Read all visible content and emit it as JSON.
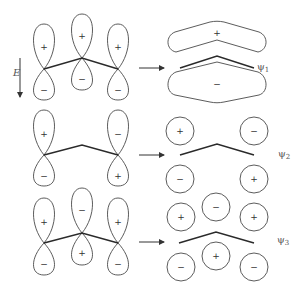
{
  "figure": {
    "energy_axis_label": "E",
    "rows": [
      {
        "id": "psi1",
        "label": "ψ",
        "subscript": "1",
        "p_orbitals": [
          {
            "top_sign": "+",
            "bottom_sign": "−"
          },
          {
            "top_sign": "+",
            "bottom_sign": "−"
          },
          {
            "top_sign": "+",
            "bottom_sign": "−"
          }
        ],
        "mo_signs": {
          "top": "+",
          "bottom": "−"
        }
      },
      {
        "id": "psi2",
        "label": "ψ",
        "subscript": "2",
        "p_orbitals": [
          {
            "top_sign": "+",
            "bottom_sign": "−"
          },
          null,
          {
            "top_sign": "−",
            "bottom_sign": "+"
          }
        ],
        "mo_signs": {
          "top": [
            "+",
            "−"
          ],
          "bottom": [
            "−",
            "+"
          ]
        }
      },
      {
        "id": "psi3",
        "label": "ψ",
        "subscript": "3",
        "p_orbitals": [
          {
            "top_sign": "+",
            "bottom_sign": "−"
          },
          {
            "top_sign": "−",
            "bottom_sign": "+"
          },
          {
            "top_sign": "+",
            "bottom_sign": "−"
          }
        ],
        "mo_signs": {
          "top": [
            "+",
            "−",
            "+"
          ],
          "bottom": [
            "−",
            "+",
            "−"
          ]
        }
      }
    ]
  }
}
